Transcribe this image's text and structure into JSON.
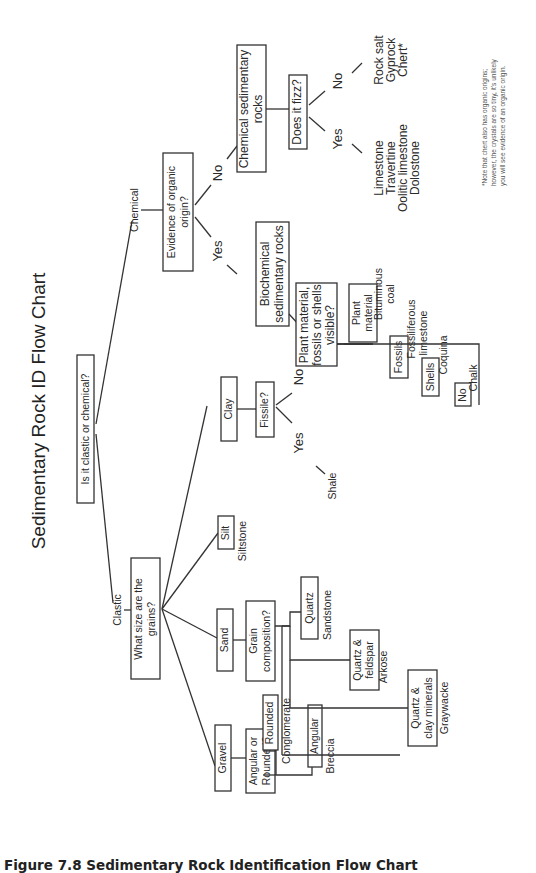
{
  "title": "Sedimentary Rock ID Flow Chart",
  "caption": "Figure 7.8 Sedimentary Rock Identification Flow Chart",
  "root_question": "Is it clastic or chemical?",
  "clastic": {
    "label": "Clastic",
    "question": [
      "What size are the",
      "grains?"
    ],
    "gravel": {
      "label": "Gravel",
      "question": [
        "Angular or",
        "Rounded?"
      ],
      "rounded": {
        "label": "Rounded",
        "rock": "Conglomerate"
      },
      "angular": {
        "label": "Angular",
        "rock": "Breccia"
      }
    },
    "sand": {
      "label": "Sand",
      "question": [
        "Grain",
        "composition?"
      ],
      "quartz": {
        "label": "Quartz",
        "rock": "Sandstone"
      },
      "quartz_feldspar": {
        "label": [
          "Quartz &",
          "feldspar"
        ],
        "rock": "Arkose"
      },
      "quartz_clay": {
        "label": [
          "Quartz &",
          "clay minerals"
        ],
        "rock": "Graywacke"
      }
    },
    "silt": {
      "label": "Silt",
      "rock": "Siltstone"
    },
    "clay": {
      "label": "Clay",
      "question": "Fissile?",
      "yes": {
        "label": "Yes",
        "rock": "Shale"
      },
      "no": {
        "label": "No",
        "rock": "Mudstone"
      }
    }
  },
  "chemical": {
    "label": "Chemical",
    "question": [
      "Evidence of organic",
      "origin?"
    ],
    "yes": {
      "label": "Yes",
      "group": [
        "Biochemical",
        "sedimentary rocks"
      ],
      "question": [
        "Plant material,",
        "fossils or shells",
        "visible?"
      ],
      "plant": {
        "label": [
          "Plant",
          "material"
        ],
        "rock": [
          "Bituminous",
          "coal"
        ]
      },
      "fossils": {
        "label": "Fossils",
        "rock": [
          "Fossiliferous",
          "limestone"
        ]
      },
      "shells": {
        "label": "Shells",
        "rock": "Coquina"
      },
      "none": {
        "label": "No",
        "rock": "Chalk"
      }
    },
    "no": {
      "label": "No",
      "group": [
        "Chemical sedimentary",
        "rocks"
      ],
      "question": "Does it fizz?",
      "yes": {
        "label": "Yes",
        "rocks": [
          "Limestone",
          "Travertine",
          "Oolitic limestone",
          "Dolostone"
        ]
      },
      "no": {
        "label": "No",
        "rocks": [
          "Rock salt",
          "Gyprock",
          "Chert*"
        ]
      }
    }
  },
  "note": [
    "*Note that chert also has organic origins;",
    "however, the crystals are so tiny, it's unlikely",
    "you will see evidence of an organic origin."
  ]
}
